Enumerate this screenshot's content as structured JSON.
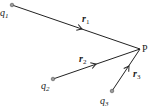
{
  "diagram": {
    "point": {
      "label": "P"
    },
    "charges": [
      {
        "name": "q",
        "sub": "1",
        "vector": "r",
        "vector_sub": "1"
      },
      {
        "name": "q",
        "sub": "2",
        "vector": "r",
        "vector_sub": "2"
      },
      {
        "name": "q",
        "sub": "3",
        "vector": "r",
        "vector_sub": "3"
      }
    ],
    "colors": {
      "line": "#222222",
      "dot_fill": "#9a9a9a"
    }
  }
}
